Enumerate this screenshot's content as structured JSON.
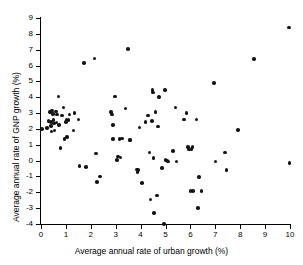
{
  "chart_data": {
    "type": "scatter",
    "title": "",
    "xlabel": "Average annual rate of urban growth (%)",
    "ylabel": "Average annual rate of GNP growth (%)",
    "xlim": [
      0,
      10
    ],
    "ylim": [
      -4,
      9
    ],
    "xticks": [
      0,
      1,
      2,
      3,
      4,
      5,
      6,
      7,
      8,
      9,
      10
    ],
    "yticks": [
      -4,
      -3,
      -2,
      -1,
      0,
      1,
      2,
      3,
      4,
      5,
      6,
      7,
      8,
      9
    ],
    "xticklabels": [
      "0",
      "1",
      "2",
      "3",
      "4",
      "5",
      "6",
      "7",
      "8",
      "9",
      "10"
    ],
    "yticklabels": [
      "-4",
      "-3",
      "-2",
      "-1",
      "0",
      "1",
      "2",
      "3",
      "4",
      "5",
      "6",
      "7",
      "8",
      "9"
    ],
    "grid": false,
    "legend": null,
    "marker": "filled-circle",
    "marker_color": "#141414",
    "points": [
      [
        0.05,
        2.0
      ],
      [
        0.25,
        2.05
      ],
      [
        0.3,
        2.5
      ],
      [
        0.35,
        3.05
      ],
      [
        0.4,
        2.45
      ],
      [
        0.4,
        2.2
      ],
      [
        0.42,
        1.85
      ],
      [
        0.45,
        3.15
      ],
      [
        0.48,
        2.95
      ],
      [
        0.5,
        2.55
      ],
      [
        0.52,
        2.35
      ],
      [
        0.55,
        1.9
      ],
      [
        0.6,
        3.1
      ],
      [
        0.62,
        2.4
      ],
      [
        0.65,
        2.9
      ],
      [
        0.7,
        4.05
      ],
      [
        0.72,
        2.25
      ],
      [
        0.78,
        0.8
      ],
      [
        0.85,
        2.85
      ],
      [
        0.9,
        3.35
      ],
      [
        0.95,
        1.35
      ],
      [
        1.0,
        2.45
      ],
      [
        1.02,
        2.6
      ],
      [
        1.05,
        1.5
      ],
      [
        1.1,
        2.55
      ],
      [
        1.15,
        2.9
      ],
      [
        1.3,
        1.9
      ],
      [
        1.35,
        3.0
      ],
      [
        1.5,
        2.6
      ],
      [
        1.55,
        -0.35
      ],
      [
        1.72,
        6.15
      ],
      [
        1.8,
        -0.4
      ],
      [
        2.15,
        6.45
      ],
      [
        2.2,
        0.45
      ],
      [
        2.25,
        -1.35
      ],
      [
        2.38,
        -1.0
      ],
      [
        2.8,
        3.05
      ],
      [
        2.85,
        2.9
      ],
      [
        2.88,
        2.25
      ],
      [
        2.9,
        1.35
      ],
      [
        2.98,
        4.05
      ],
      [
        3.05,
        0.05
      ],
      [
        3.1,
        0.25
      ],
      [
        3.15,
        1.35
      ],
      [
        3.2,
        0.2
      ],
      [
        3.25,
        1.4
      ],
      [
        3.4,
        3.3
      ],
      [
        3.5,
        7.05
      ],
      [
        3.55,
        1.3
      ],
      [
        3.6,
        1.3
      ],
      [
        3.85,
        -0.55
      ],
      [
        3.88,
        -0.7
      ],
      [
        3.9,
        -0.6
      ],
      [
        3.95,
        2.1
      ],
      [
        4.05,
        -1.4
      ],
      [
        4.2,
        2.45
      ],
      [
        4.3,
        2.85
      ],
      [
        4.35,
        0.5
      ],
      [
        4.4,
        -2.45
      ],
      [
        4.45,
        2.5
      ],
      [
        4.48,
        4.45
      ],
      [
        4.5,
        4.3
      ],
      [
        4.52,
        0.15
      ],
      [
        4.55,
        -3.3
      ],
      [
        4.6,
        3.05
      ],
      [
        4.65,
        -2.2
      ],
      [
        4.7,
        2.15
      ],
      [
        4.75,
        4.0
      ],
      [
        4.85,
        -0.45
      ],
      [
        4.95,
        -4.0
      ],
      [
        4.98,
        4.45
      ],
      [
        5.0,
        0.05
      ],
      [
        5.05,
        0.0
      ],
      [
        5.1,
        -0.05
      ],
      [
        5.3,
        0.6
      ],
      [
        5.4,
        3.35
      ],
      [
        5.45,
        -0.05
      ],
      [
        5.75,
        2.6
      ],
      [
        5.85,
        3.0
      ],
      [
        5.9,
        0.85
      ],
      [
        5.95,
        0.7
      ],
      [
        6.0,
        -1.9
      ],
      [
        6.05,
        0.75
      ],
      [
        6.08,
        0.85
      ],
      [
        6.1,
        -1.9
      ],
      [
        6.25,
        2.6
      ],
      [
        6.3,
        -3.0
      ],
      [
        6.35,
        -1.05
      ],
      [
        6.45,
        -1.9
      ],
      [
        6.95,
        4.9
      ],
      [
        7.0,
        -0.05
      ],
      [
        7.4,
        0.5
      ],
      [
        7.45,
        -0.6
      ],
      [
        7.9,
        1.95
      ],
      [
        8.55,
        6.4
      ],
      [
        9.95,
        8.4
      ],
      [
        9.98,
        -0.15
      ]
    ]
  }
}
